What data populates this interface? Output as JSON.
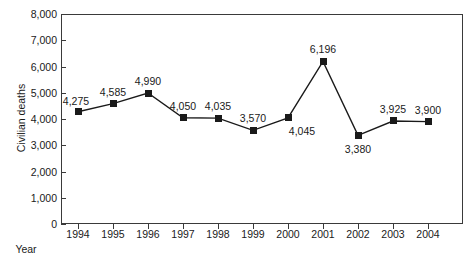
{
  "chart_data": {
    "type": "line",
    "title": "",
    "xlabel": "Year",
    "ylabel": "Civilian deaths",
    "categories": [
      "1994",
      "1995",
      "1996",
      "1997",
      "1998",
      "1999",
      "2000",
      "2001",
      "2002",
      "2003",
      "2004"
    ],
    "values": [
      4275,
      4585,
      4990,
      4050,
      4035,
      3570,
      4045,
      6196,
      3380,
      3925,
      3900
    ],
    "point_labels": [
      "4,275",
      "4,585",
      "4,990",
      "4,050",
      "4,035",
      "3,570",
      "4,045",
      "6,196",
      "3,380",
      "3,925",
      "3,900"
    ],
    "label_positions": [
      "above-left",
      "above",
      "above",
      "above",
      "above",
      "above",
      "below-right",
      "above",
      "below",
      "above",
      "above"
    ],
    "ylim": [
      0,
      8000
    ],
    "ytick_values": [
      0,
      1000,
      2000,
      3000,
      4000,
      5000,
      6000,
      7000,
      8000
    ],
    "ytick_labels": [
      "0",
      "1,000",
      "2,000",
      "3,000",
      "4,000",
      "5,000",
      "6,000",
      "7,000",
      "8,000"
    ],
    "grid": false,
    "legend": false,
    "marker": "square",
    "line_color": "#1a1a1a",
    "marker_color": "#1a1a1a",
    "frame_color": "#3a3a3a",
    "background": "#ffffff"
  }
}
